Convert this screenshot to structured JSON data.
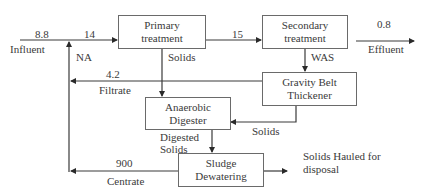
{
  "diagram": {
    "nodes": {
      "primary": {
        "line1": "Primary",
        "line2": "treatment"
      },
      "secondary": {
        "line1": "Secondary",
        "line2": "treatment"
      },
      "gbt": {
        "line1": "Gravity Belt",
        "line2": "Thickener"
      },
      "digester": {
        "line1": "Anaerobic",
        "line2": "Digester"
      },
      "dewatering": {
        "line1": "Sludge",
        "line2": "Dewatering"
      }
    },
    "flows": {
      "influent": {
        "value": "8.8",
        "label": "Influent"
      },
      "combined": {
        "value": "14"
      },
      "recycle_note": {
        "label": "NA"
      },
      "primary_to_secondary": {
        "value": "15"
      },
      "effluent": {
        "value": "0.8",
        "label": "Effluent"
      },
      "primary_solids": {
        "label": "Solids"
      },
      "was": {
        "label": "WAS"
      },
      "filtrate": {
        "value": "4.2",
        "label": "Filtrate"
      },
      "thickened_solids": {
        "label": "Solids"
      },
      "digested": {
        "line1": "Digested",
        "line2": "Solids"
      },
      "centrate": {
        "value": "900",
        "label": "Centrate"
      },
      "hauled": {
        "line1": "Solids Hauled for",
        "line2": "disposal"
      }
    },
    "colors": {
      "line": "#3a3a3a",
      "box_border": "#6a6a6a",
      "text": "#3a3a3a"
    }
  }
}
